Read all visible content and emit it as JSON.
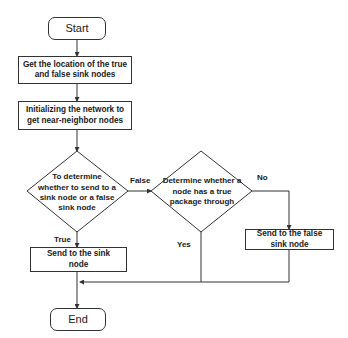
{
  "flowchart": {
    "start": "Start",
    "step1": "Get the location of the true and false sink nodes",
    "step2": "Initializing the network to get near-neighbor nodes",
    "decision1": "To determine whether to send to a sink node or a false sink node",
    "decision2": "Determine whether a node has a true package through",
    "send_sink": "Send to the sink node",
    "send_false_sink": "Send to the false sink node",
    "end": "End",
    "edge_labels": {
      "false": "False",
      "true": "True",
      "no": "No",
      "yes": "Yes"
    }
  }
}
